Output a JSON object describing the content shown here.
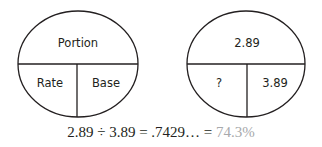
{
  "diagrams": [
    {
      "name": "formula-circle",
      "top": "Portion",
      "bottom_left": "Rate",
      "bottom_right": "Base"
    },
    {
      "name": "example-circle",
      "top": "2.89",
      "bottom_left": "?",
      "bottom_right": "3.89"
    }
  ],
  "equation": {
    "expression": "2.89 ÷ 3.89 = .7429… = ",
    "result": "74.3%"
  },
  "colors": {
    "stroke": "#231f20",
    "text": "#231f20",
    "result": "#a7a9ac"
  }
}
